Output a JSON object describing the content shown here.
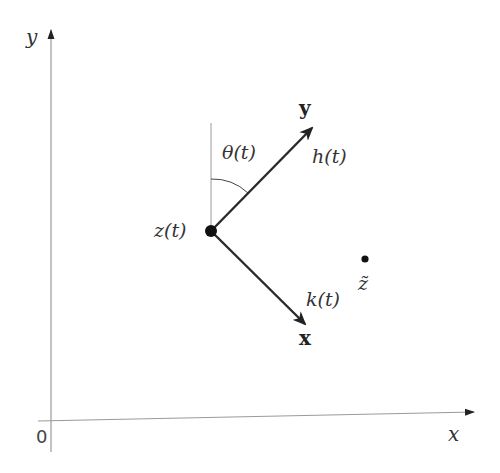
{
  "diagram": {
    "axes": {
      "x_label": "x",
      "y_label": "y",
      "origin_label": "0"
    },
    "point_z": {
      "label": "z(t)"
    },
    "point_z_tilde": {
      "label": "z̃"
    },
    "vector_y": {
      "label": "y",
      "magnitude_label": "h(t)"
    },
    "vector_x": {
      "label": "x",
      "magnitude_label": "k(t)"
    },
    "angle": {
      "label": "θ(t)"
    },
    "colors": {
      "axis": "#9a9a9a",
      "vector": "#2a2a2a",
      "point": "#111111"
    }
  }
}
